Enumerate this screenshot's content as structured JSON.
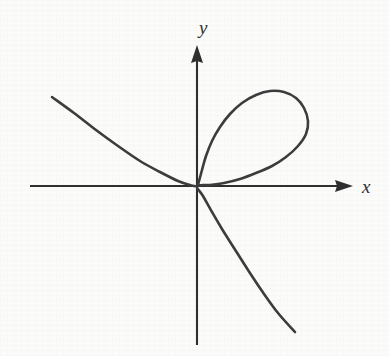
{
  "figure": {
    "kind": "math-curve-plot",
    "background_color": "#fbfbfa",
    "curve_color": "#3c3c3c",
    "axis_color": "#2e2e2e",
    "label_color": "#2e2e2e",
    "x_axis_label": "x",
    "y_axis_label": "y"
  },
  "chart_data": {
    "type": "line",
    "title": "",
    "subtitle": "",
    "xlabel": "x",
    "ylabel": "y",
    "legend": [],
    "legend_position": "none",
    "grid": false,
    "axis_style": "arrowed-cartesian-axes",
    "origin_px": [
      197,
      186
    ],
    "xlim_px": [
      30,
      353
    ],
    "ylim_px": [
      45,
      345
    ],
    "annotations": [],
    "tick_labels": {
      "x": [],
      "y": []
    },
    "series": [
      {
        "name": "nodal-cubic-curve",
        "description": "self-intersecting curve with a loop in the first quadrant, a branch rising into the second quadrant, and a branch descending into the fourth quadrant; all three meet at the origin",
        "color": "#3c3c3c",
        "linewidth_px": 2.6,
        "points_px": [
          [
            52,
            97
          ],
          [
            74,
            113
          ],
          [
            96,
            130
          ],
          [
            118,
            146
          ],
          [
            140,
            161
          ],
          [
            160,
            172
          ],
          [
            178,
            181
          ],
          [
            190,
            185
          ],
          [
            197,
            186
          ],
          [
            199,
            181
          ],
          [
            202,
            170
          ],
          [
            206,
            156
          ],
          [
            212,
            141
          ],
          [
            220,
            127
          ],
          [
            230,
            114
          ],
          [
            242,
            103
          ],
          [
            256,
            95
          ],
          [
            270,
            91
          ],
          [
            284,
            92
          ],
          [
            296,
            98
          ],
          [
            304,
            108
          ],
          [
            308,
            121
          ],
          [
            306,
            134
          ],
          [
            298,
            146
          ],
          [
            286,
            157
          ],
          [
            272,
            166
          ],
          [
            256,
            173
          ],
          [
            240,
            179
          ],
          [
            224,
            183
          ],
          [
            210,
            185
          ],
          [
            197,
            186
          ],
          [
            203,
            196
          ],
          [
            212,
            212
          ],
          [
            222,
            229
          ],
          [
            234,
            248
          ],
          [
            248,
            270
          ],
          [
            262,
            291
          ],
          [
            278,
            313
          ],
          [
            295,
            332
          ]
        ]
      }
    ]
  },
  "axes": {
    "x_axis": {
      "start_px": [
        30,
        186
      ],
      "end_px": [
        353,
        186
      ],
      "has_arrow_end": true
    },
    "y_axis": {
      "start_px": [
        197,
        345
      ],
      "end_px": [
        197,
        45
      ],
      "has_arrow_end": true
    }
  }
}
